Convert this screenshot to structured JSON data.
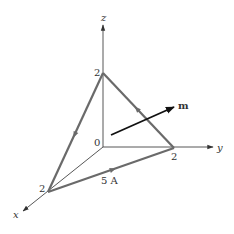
{
  "figure": {
    "type": "3d-axes-triangle-loop",
    "colors": {
      "axis": "#444444",
      "loop": "#6a6a6a",
      "vector": "#111111",
      "text": "#333333"
    },
    "axes": {
      "x": {
        "label": "x",
        "tick_label": "2"
      },
      "y": {
        "label": "y",
        "tick_label": "2"
      },
      "z": {
        "label": "z",
        "tick_label": "2"
      },
      "origin_label": "0"
    },
    "loop": {
      "current_label": "5 A",
      "vertices": [
        "(2,0,0)",
        "(0,2,0)",
        "(0,0,2)"
      ],
      "direction": "x-vertex → y-vertex → z-vertex → x-vertex"
    },
    "vector": {
      "label": "m"
    }
  }
}
